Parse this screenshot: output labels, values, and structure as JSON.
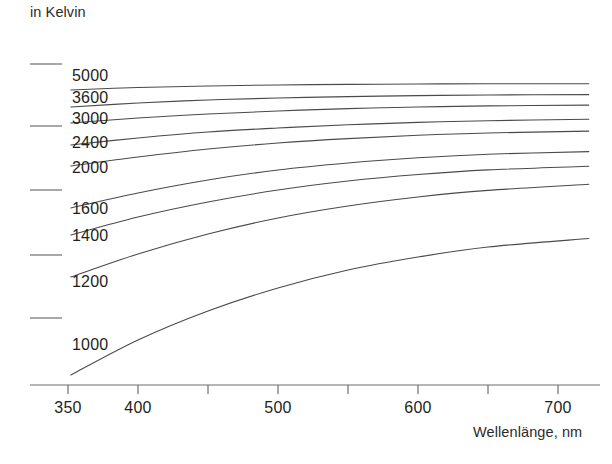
{
  "axis": {
    "y_unit_title": "in Kelvin",
    "x_title": "Wellenlänge, nm"
  },
  "chart_data": {
    "type": "line",
    "title": "",
    "subtitle": "",
    "xlabel": "Wellenlänge, nm",
    "ylabel": "in Kelvin",
    "xlim": [
      338,
      735
    ],
    "xticks": [
      350,
      400,
      450,
      500,
      550,
      600,
      650,
      700
    ],
    "xtick_labels": [
      "350",
      "400",
      "",
      "500",
      "",
      "600",
      "",
      "700"
    ],
    "labeled_xticks": [
      "350",
      "400",
      "500",
      "600",
      "700"
    ],
    "yticks_unlabeled_count": 5,
    "grid": false,
    "legend": "inline-curve-labels",
    "legend_position": "left-inline",
    "series": [
      {
        "name": "5000",
        "label": "5000",
        "x": [
          352,
          400,
          450,
          500,
          550,
          600,
          650,
          722
        ],
        "y_px": [
          90,
          87.5,
          86,
          85,
          84.4,
          84.0,
          83.8,
          83.8
        ],
        "label_pos_px": [
          72,
          68
        ]
      },
      {
        "name": "3600",
        "label": "3600",
        "x": [
          352,
          400,
          450,
          500,
          550,
          600,
          650,
          722
        ],
        "y_px": [
          107,
          103,
          100,
          98,
          96.6,
          95.6,
          95.0,
          94.6
        ],
        "label_pos_px": [
          72,
          90
        ]
      },
      {
        "name": "3000",
        "label": "3000",
        "x": [
          352,
          400,
          450,
          500,
          550,
          600,
          650,
          722
        ],
        "y_px": [
          123,
          118,
          114,
          111,
          108.6,
          107.0,
          105.9,
          105.1
        ],
        "label_pos_px": [
          72,
          111
        ]
      },
      {
        "name": "2400",
        "label": "2400",
        "x": [
          352,
          400,
          450,
          500,
          550,
          600,
          650,
          722
        ],
        "y_px": [
          145,
          138,
          132,
          128,
          124.8,
          122.4,
          120.7,
          119.3
        ],
        "label_pos_px": [
          72,
          135
        ]
      },
      {
        "name": "2000",
        "label": "2000",
        "x": [
          352,
          400,
          450,
          500,
          550,
          600,
          650,
          722
        ],
        "y_px": [
          166,
          157,
          149,
          143,
          138.6,
          135.3,
          133.0,
          131.1
        ],
        "label_pos_px": [
          72,
          160
        ]
      },
      {
        "name": "1600",
        "label": "1600",
        "x": [
          352,
          400,
          450,
          500,
          550,
          600,
          650,
          722
        ],
        "y_px": [
          208,
          193,
          180,
          170,
          163.0,
          157.8,
          154.2,
          151.6
        ],
        "label_pos_px": [
          72,
          201
        ]
      },
      {
        "name": "1400",
        "label": "1400",
        "x": [
          352,
          400,
          450,
          500,
          550,
          600,
          650,
          722
        ],
        "y_px": [
          235,
          217,
          202,
          190,
          181.0,
          174.5,
          169.9,
          166.3
        ],
        "label_pos_px": [
          72,
          228
        ]
      },
      {
        "name": "1200",
        "label": "1200",
        "x": [
          352,
          400,
          450,
          500,
          550,
          600,
          650,
          722
        ],
        "y_px": [
          277,
          254,
          234,
          218,
          206.0,
          197.0,
          190.4,
          184.3
        ],
        "label_pos_px": [
          72,
          274
        ]
      },
      {
        "name": "1000",
        "label": "1000",
        "x": [
          352,
          400,
          450,
          500,
          550,
          600,
          650,
          722
        ],
        "y_px": [
          375,
          340,
          311,
          288,
          270.0,
          257.0,
          247.0,
          238.5
        ],
        "label_pos_px": [
          72,
          337
        ]
      }
    ],
    "axis_geometry": {
      "x_axis_y_px": 385,
      "x_axis_x0_px": 30,
      "x_axis_x1_px": 600,
      "x_at_350_px": 68,
      "px_per_nm": 1.4,
      "ytick_x0_px": 30,
      "ytick_x1_px": 62,
      "ytick_y_px": [
        64,
        126,
        190,
        255,
        318
      ],
      "tick_len_px": 9
    },
    "style": {
      "line_color": "#4a4a4a",
      "axis_color": "#6e6e6e",
      "text_color": "#231f20",
      "background": "#ffffff",
      "line_width_px": 1.1
    }
  }
}
